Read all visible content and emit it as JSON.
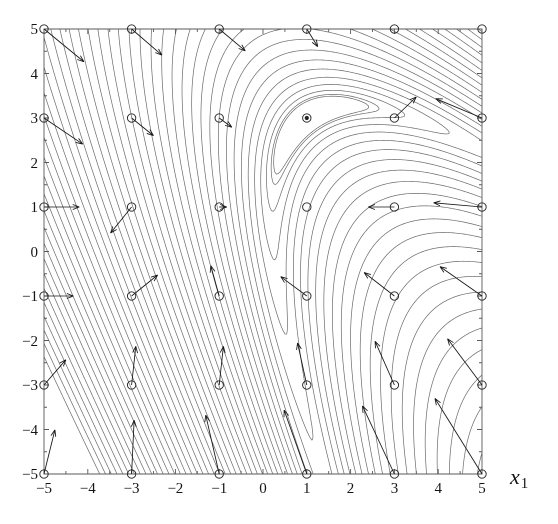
{
  "chart_data": {
    "type": "contour",
    "title": "",
    "xlabel": "x_1",
    "xlabel_base": "x",
    "xlabel_sub": "1",
    "ylabel": "",
    "xlim": [
      -5,
      5
    ],
    "ylim": [
      -5,
      5
    ],
    "xticks": [
      -5,
      -4,
      -3,
      -2,
      -1,
      0,
      1,
      2,
      3,
      4,
      5
    ],
    "xticklabels": [
      "−5",
      "−4",
      "−3",
      "−2",
      "−1",
      "0",
      "1",
      "2",
      "3",
      "4",
      "5"
    ],
    "yticks": [
      -5,
      -4,
      -3,
      -2,
      -1,
      0,
      1,
      2,
      3,
      4,
      5
    ],
    "yticklabels": [
      "5",
      "4",
      "3",
      "2",
      "1",
      "0",
      "−1",
      "−2",
      "−3",
      "−4",
      "−5"
    ],
    "grid": false,
    "legend": null,
    "function": "banana",
    "function_params": {
      "a": 1.0,
      "b": 0.35,
      "cx": 1.0,
      "cy": 3.0,
      "rot": 0.62
    },
    "contour_count": 46,
    "contour_color": "#6b6b6b",
    "contour_width": 0.7,
    "axis_color": "#595959",
    "marker_radius": 4.2,
    "marker_color": "#222222",
    "arrow_color": "#151515",
    "minimum_marker": {
      "x": 1,
      "y": 3,
      "filled": true
    },
    "sample_x": [
      -5,
      -3,
      -1,
      1,
      3,
      5
    ],
    "sample_y": [
      -5,
      -3,
      -1,
      1,
      3,
      5
    ],
    "arrows": [
      {
        "x": -5,
        "y": 5,
        "dx": 0.95,
        "dy": -0.78
      },
      {
        "x": -3,
        "y": 5,
        "dx": 0.72,
        "dy": -0.62
      },
      {
        "x": -1,
        "y": 5,
        "dx": 0.62,
        "dy": -0.52
      },
      {
        "x": 1,
        "y": 5,
        "dx": 0.26,
        "dy": -0.42
      },
      {
        "x": 3,
        "y": 5,
        "dx": 0.0,
        "dy": 0.0
      },
      {
        "x": 5,
        "y": 5,
        "dx": 0.0,
        "dy": 0.0
      },
      {
        "x": -5,
        "y": 3,
        "dx": 0.92,
        "dy": -0.62
      },
      {
        "x": -3,
        "y": 3,
        "dx": 0.52,
        "dy": -0.42
      },
      {
        "x": -1,
        "y": 3,
        "dx": 0.3,
        "dy": -0.22
      },
      {
        "x": 1,
        "y": 3,
        "dx": 0.0,
        "dy": 0.0
      },
      {
        "x": 3,
        "y": 3,
        "dx": 0.52,
        "dy": 0.5
      },
      {
        "x": 5,
        "y": 3,
        "dx": -1.1,
        "dy": 0.46
      },
      {
        "x": -5,
        "y": 1,
        "dx": 0.84,
        "dy": 0.0
      },
      {
        "x": -3,
        "y": 1,
        "dx": -0.5,
        "dy": -0.62
      },
      {
        "x": -1,
        "y": 1,
        "dx": 0.18,
        "dy": 0.0
      },
      {
        "x": 1,
        "y": 1,
        "dx": 0.0,
        "dy": 0.0
      },
      {
        "x": 3,
        "y": 1,
        "dx": -0.62,
        "dy": 0.0
      },
      {
        "x": 5,
        "y": 1,
        "dx": -1.15,
        "dy": 0.1
      },
      {
        "x": -5,
        "y": -1,
        "dx": 0.7,
        "dy": 0.0
      },
      {
        "x": -3,
        "y": -1,
        "dx": 0.62,
        "dy": 0.5
      },
      {
        "x": -1,
        "y": -1,
        "dx": -0.2,
        "dy": 0.72
      },
      {
        "x": 1,
        "y": -1,
        "dx": -0.62,
        "dy": 0.46
      },
      {
        "x": 3,
        "y": -1,
        "dx": -0.72,
        "dy": 0.56
      },
      {
        "x": 5,
        "y": -1,
        "dx": -1.0,
        "dy": 0.7
      },
      {
        "x": -5,
        "y": -3,
        "dx": 0.52,
        "dy": 0.6
      },
      {
        "x": -3,
        "y": -3,
        "dx": 0.1,
        "dy": 0.92
      },
      {
        "x": -1,
        "y": -3,
        "dx": 0.1,
        "dy": 0.92
      },
      {
        "x": 1,
        "y": -3,
        "dx": -0.22,
        "dy": 1.0
      },
      {
        "x": 3,
        "y": -3,
        "dx": -0.46,
        "dy": 1.04
      },
      {
        "x": 5,
        "y": -3,
        "dx": -0.82,
        "dy": 1.1
      },
      {
        "x": -5,
        "y": -5,
        "dx": 0.26,
        "dy": 1.05
      },
      {
        "x": -3,
        "y": -5,
        "dx": 0.06,
        "dy": 1.28
      },
      {
        "x": -1,
        "y": -5,
        "dx": -0.32,
        "dy": 1.4
      },
      {
        "x": 1,
        "y": -5,
        "dx": -0.54,
        "dy": 1.52
      },
      {
        "x": 3,
        "y": -5,
        "dx": -0.76,
        "dy": 1.62
      },
      {
        "x": 5,
        "y": -5,
        "dx": -1.12,
        "dy": 1.8
      }
    ]
  },
  "plot_box": {
    "left": 44,
    "top": 29,
    "right": 482,
    "bottom": 474
  }
}
